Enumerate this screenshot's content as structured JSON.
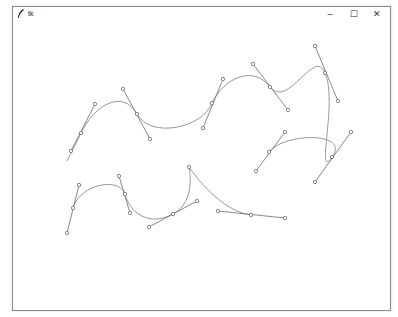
{
  "window": {
    "title": "tk",
    "app_icon": "feather-icon",
    "controls": {
      "minimize": "–",
      "maximize": "☐",
      "close": "✕"
    }
  },
  "canvas": {
    "curve_color": "#8c8c8c",
    "handle_color": "#6a6a6a",
    "curves": [
      {
        "name": "upper-curve",
        "start": [
          66,
          160
        ],
        "anchors": [
          {
            "pt": [
              80,
              132
            ],
            "h_in": [
              70,
              150
            ],
            "h_out": [
              94,
              103
            ]
          },
          {
            "pt": [
              136,
              113
            ],
            "h_in": [
              122,
              88
            ],
            "h_out": [
              149,
              138
            ]
          },
          {
            "pt": [
              211,
              102
            ],
            "h_in": [
              202,
              127
            ],
            "h_out": [
              222,
              78
            ]
          },
          {
            "pt": [
              269,
              86
            ],
            "h_in": [
              252,
              63
            ],
            "h_out": [
              287,
              109
            ]
          },
          {
            "pt": [
              324,
              72
            ],
            "h_in": [
              314,
              45
            ],
            "h_out": [
              337,
              100
            ]
          },
          {
            "pt": [
              331,
              156
            ],
            "h_in": [
              314,
              181
            ],
            "h_out": [
              350,
              131
            ]
          },
          {
            "pt": [
              268,
              151
            ],
            "h_in": [
              284,
              131
            ],
            "h_out": [
              255,
              170
            ]
          }
        ]
      },
      {
        "name": "lower-curve",
        "anchors": [
          {
            "pt": [
              72,
              207
            ],
            "h_in": [
              66,
              232
            ],
            "h_out": [
              78,
              184
            ]
          },
          {
            "pt": [
              124,
              193
            ],
            "h_in": [
              118,
              175
            ],
            "h_out": [
              129,
              212
            ]
          },
          {
            "pt": [
              172,
              213
            ],
            "h_in": [
              148,
              226
            ],
            "h_out": [
              196,
              200
            ]
          },
          {
            "pt": [
              188,
              166
            ],
            "h_in": [
              188,
              166
            ],
            "h_out": [
              188,
              166
            ]
          },
          {
            "pt": [
              250,
              214
            ],
            "h_in": [
              217,
              210
            ],
            "h_out": [
              284,
              217
            ]
          }
        ]
      }
    ]
  }
}
